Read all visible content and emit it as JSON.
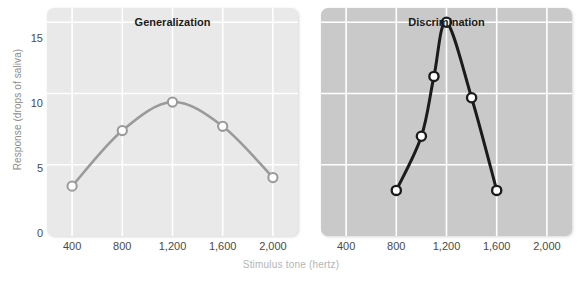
{
  "figure": {
    "axis_x_title": "Stimulus tone (hertz)",
    "axis_y_title": "Response (drops of saliva)"
  },
  "chart_data": {
    "type": "line",
    "title": "",
    "xlabel": "Stimulus tone (hertz)",
    "ylabel": "Response (drops of saliva)",
    "xlim": [
      200,
      2200
    ],
    "ylim": [
      0,
      16
    ],
    "xticks": [
      400,
      800,
      1200,
      1600,
      2000
    ],
    "xticklabels": [
      "400",
      "800",
      "1,200",
      "1,600",
      "2,000"
    ],
    "yticks": [
      0,
      5,
      10,
      15
    ],
    "yticklabels": [
      "0",
      "5",
      "10",
      "15"
    ],
    "grid": true,
    "legend": "none",
    "panels": [
      {
        "id": "generalization",
        "title": "Generalization",
        "line_color": "#9a9a9a",
        "marker_face": "#ffffff",
        "plot_background": "#e9e9e9",
        "x": [
          400,
          800,
          1200,
          1600,
          2000
        ],
        "y": [
          3.5,
          7.4,
          9.4,
          7.7,
          4.1
        ]
      },
      {
        "id": "discrimination",
        "title": "Discrimination",
        "line_color": "#1b1b1b",
        "marker_face": "#ffffff",
        "plot_background": "#c9c9c9",
        "x": [
          800,
          1000,
          1100,
          1200,
          1400,
          1600
        ],
        "y": [
          3.2,
          7.0,
          11.2,
          15.0,
          9.7,
          3.2
        ]
      }
    ]
  }
}
